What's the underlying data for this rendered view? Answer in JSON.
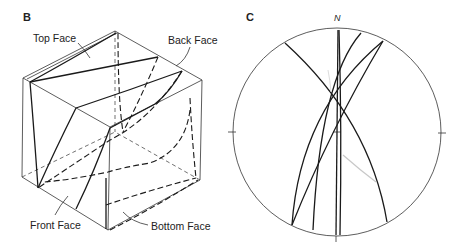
{
  "panels": {
    "b": {
      "label": "B",
      "faces": {
        "top": "Top Face",
        "back": "Back Face",
        "front": "Front Face",
        "bottom": "Bottom Face"
      }
    },
    "c": {
      "label": "C",
      "north_label": "N"
    }
  },
  "colors": {
    "line": "#1a1a1a",
    "edge": "#333333",
    "background": "#ffffff"
  }
}
